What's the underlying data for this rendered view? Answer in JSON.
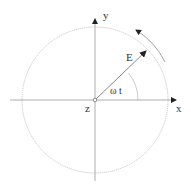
{
  "diagram": {
    "labels": {
      "x_axis": "x",
      "y_axis": "y",
      "z_axis": "z",
      "vector": "E",
      "angle": "ω t"
    },
    "colors": {
      "axis": "#8a8a8a",
      "circle": "#bdbdbd",
      "vector": "#7a7a7a",
      "text": "#333333",
      "arrowhead": "#222222"
    }
  }
}
